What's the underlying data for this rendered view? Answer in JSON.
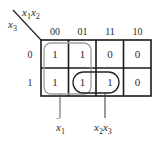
{
  "kmap": {
    "row_var": "x3",
    "col_vars": "x1x2",
    "col_headers": [
      "00",
      "01",
      "11",
      "10"
    ],
    "row_headers": [
      "0",
      "1"
    ],
    "cells": [
      [
        "1",
        "1",
        "0",
        "0"
      ],
      [
        "1",
        "1",
        "1",
        "0"
      ]
    ],
    "groups": [
      {
        "name": "group-x1-bar",
        "label": "x̄1",
        "color": "#9a9a9a",
        "cells": [
          [
            0,
            0
          ],
          [
            0,
            1
          ],
          [
            1,
            0
          ],
          [
            1,
            1
          ]
        ]
      },
      {
        "name": "group-x2x3",
        "label": "x2x3",
        "color": "#222222",
        "cells": [
          [
            1,
            1
          ],
          [
            1,
            2
          ]
        ]
      }
    ]
  },
  "labels": {
    "corner_top": "x",
    "corner_top_sub1": "1",
    "corner_top_x2": "x",
    "corner_top_sub2": "2",
    "corner_left": "x",
    "corner_left_sub": "3",
    "group1_base": "x",
    "group1_sub": "1",
    "group1_bar": "ˉ",
    "group2_x2": "x",
    "group2_sub2": "2",
    "group2_x3": "x",
    "group2_sub3": "3"
  }
}
